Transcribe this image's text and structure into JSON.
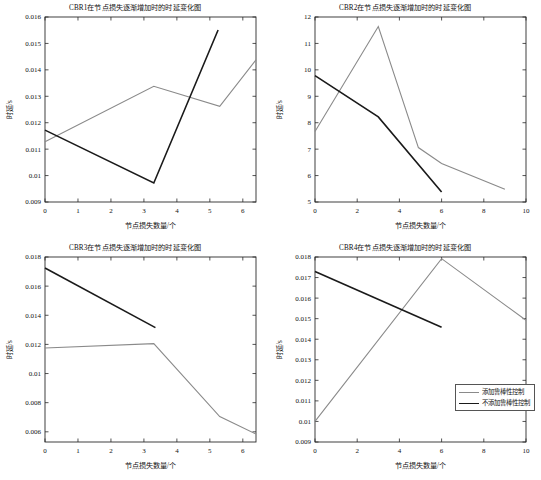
{
  "figure": {
    "background_color": "#ffffff",
    "panel_count": 4
  },
  "legend": {
    "robust_label": "添加鲁棒性控制",
    "norobust_label": "不添加鲁棒性控制",
    "robust_color": "#8a8a8a",
    "norobust_color": "#1a1a1a"
  },
  "chart_data": [
    {
      "id": "cbr1",
      "type": "line",
      "title": "CBR1在节点损失逐渐增加时的时延变化图",
      "xlabel": "节点损失数量/个",
      "ylabel": "时延/s",
      "xlim": [
        0,
        6.4
      ],
      "ylim": [
        0.009,
        0.016
      ],
      "xticks": [
        0,
        1,
        2,
        3,
        4,
        5,
        6
      ],
      "yticks": [
        0.009,
        0.01,
        0.011,
        0.012,
        0.013,
        0.014,
        0.015,
        0.016
      ],
      "xticklabels": [
        "0",
        "1",
        "2",
        "3",
        "4",
        "5",
        "6"
      ],
      "yticklabels": [
        "0.009",
        "0.01",
        "0.011",
        "0.012",
        "0.013",
        "0.014",
        "0.015",
        "0.016"
      ],
      "grid": false,
      "series": [
        {
          "name": "添加鲁棒性控制",
          "color": "#8a8a8a",
          "x": [
            0,
            3.3,
            5.3,
            6.4
          ],
          "values": [
            0.01128,
            0.01338,
            0.01262,
            0.01438
          ]
        },
        {
          "name": "不添加鲁棒性控制",
          "color": "#1a1a1a",
          "x": [
            0,
            3.3,
            5.25
          ],
          "values": [
            0.01172,
            0.00972,
            0.01551
          ]
        }
      ]
    },
    {
      "id": "cbr2",
      "type": "line",
      "title": "CBR2在节点损失逐渐增加时的时延变化图",
      "xlabel": "节点损失数量/个",
      "ylabel": "时延/s",
      "xlim": [
        0,
        10
      ],
      "ylim": [
        5,
        12
      ],
      "xticks": [
        0,
        2,
        4,
        6,
        8,
        10
      ],
      "yticks": [
        5,
        6,
        7,
        8,
        9,
        10,
        11,
        12
      ],
      "xticklabels": [
        "0",
        "2",
        "4",
        "6",
        "8",
        "10"
      ],
      "yticklabels": [
        "5",
        "6",
        "7",
        "8",
        "9",
        "10",
        "11",
        "12"
      ],
      "grid": false,
      "series": [
        {
          "name": "添加鲁棒性控制",
          "color": "#8a8a8a",
          "x": [
            0,
            3,
            4.9,
            6,
            9
          ],
          "values": [
            7.67,
            11.64,
            7.06,
            6.46,
            5.48
          ]
        },
        {
          "name": "不添加鲁棒性控制",
          "color": "#1a1a1a",
          "x": [
            0,
            3,
            6
          ],
          "values": [
            9.78,
            8.22,
            5.38
          ]
        }
      ]
    },
    {
      "id": "cbr3",
      "type": "line",
      "title": "CBR3在节点损失逐渐增加时的时延变化图",
      "xlabel": "节点损失数量/个",
      "ylabel": "时延/s",
      "xlim": [
        0,
        6.4
      ],
      "ylim": [
        0.0053,
        0.018
      ],
      "xticks": [
        0,
        1,
        2,
        3,
        4,
        5,
        6
      ],
      "yticks": [
        0.006,
        0.008,
        0.01,
        0.012,
        0.014,
        0.016,
        0.018
      ],
      "xticklabels": [
        "0",
        "1",
        "2",
        "3",
        "4",
        "5",
        "6"
      ],
      "yticklabels": [
        "0.006",
        "0.008",
        "0.01",
        "0.012",
        "0.014",
        "0.016",
        "0.018"
      ],
      "grid": false,
      "series": [
        {
          "name": "添加鲁棒性控制",
          "color": "#8a8a8a",
          "x": [
            0,
            3.3,
            5.3,
            6.4
          ],
          "values": [
            0.01175,
            0.01205,
            0.00705,
            0.00585
          ]
        },
        {
          "name": "不添加鲁棒性控制",
          "color": "#1a1a1a",
          "x": [
            0,
            3.35
          ],
          "values": [
            0.01725,
            0.01315
          ]
        }
      ]
    },
    {
      "id": "cbr4",
      "type": "line",
      "title": "CBR4在节点损失逐渐增加时的时延变化图",
      "xlabel": "节点损失数量/个",
      "ylabel": "时延/s",
      "xlim": [
        0,
        10
      ],
      "ylim": [
        0.009,
        0.018
      ],
      "xticks": [
        0,
        2,
        4,
        6,
        8,
        10
      ],
      "yticks": [
        0.009,
        0.01,
        0.011,
        0.012,
        0.013,
        0.014,
        0.015,
        0.016,
        0.017,
        0.018
      ],
      "xticklabels": [
        "0",
        "2",
        "4",
        "6",
        "8",
        "10"
      ],
      "yticklabels": [
        "0.009",
        "0.01",
        "0.011",
        "0.012",
        "0.013",
        "0.014",
        "0.015",
        "0.016",
        "0.017",
        "0.018"
      ],
      "grid": false,
      "series": [
        {
          "name": "添加鲁棒性控制",
          "color": "#8a8a8a",
          "x": [
            0,
            6,
            10
          ],
          "values": [
            0.01,
            0.01792,
            0.01492
          ]
        },
        {
          "name": "不添加鲁棒性控制",
          "color": "#1a1a1a",
          "x": [
            0,
            6
          ],
          "values": [
            0.01729,
            0.01458
          ]
        }
      ]
    }
  ]
}
